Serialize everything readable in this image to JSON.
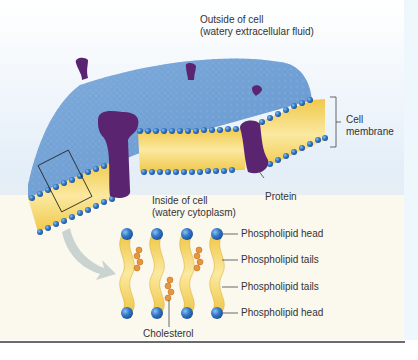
{
  "figure": {
    "labels": {
      "outside": [
        "Outside of cell",
        "(watery extracellular fluid)"
      ],
      "inside": [
        "Inside of cell",
        "(watery cytoplasm)"
      ],
      "membrane": [
        "Cell",
        "membrane"
      ],
      "protein": "Protein",
      "cholesterol": "Cholesterol",
      "detail_labels": [
        "Phospholipid head",
        "Phospholipid tails",
        "Phospholipid tails",
        "Phospholipid head"
      ]
    },
    "colors": {
      "background_top": "#dce9f5",
      "membrane_surface": "#6f9fd3",
      "head_blue": "#2f6fc0",
      "tail_yellow": "#f3cf5a",
      "protein_purple": "#5a2470",
      "cholesterol_orange": "#e8963a",
      "inside_bg": "#f6f1dc",
      "arrow_gray": "#c9d3cf"
    }
  }
}
